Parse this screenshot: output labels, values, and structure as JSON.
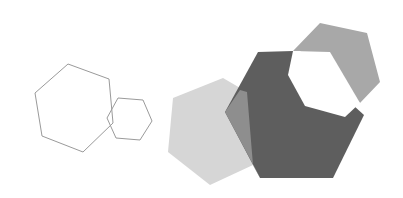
{
  "diagram": {
    "colors": {
      "background": "#ffffff",
      "outline_stroke": "#9a9a9a",
      "light_fill": "#d6d6d6",
      "medium_fill": "#9e9e9e",
      "medium_overlap": "#8a8a8a",
      "dark_fill": "#5e5e5e",
      "top_fill": "#a8a8a8",
      "cutout_fill": "#ffffff"
    },
    "outline_group": {
      "large_hexagon": "68,64 109,79 113,123 83,152 42,136 35,93",
      "small_hexagon": "118,98 143,100 152,121 140,140 116,138 107,118"
    },
    "filled_group": {
      "light_hexagon": "223,78 247,92 253,165 210,185 168,152 173,98",
      "dark_hexagon": "258,52 293,51 364,115 333,178 260,178 225,112",
      "overlap_region": "247,92 253,165 258,170 260,178 225,112 240,90",
      "top_hexagon": "320,23 367,33 380,82 360,103 300,51 293,51",
      "cutout_hexagon": "293,51 330,52 360,103 345,117 305,106 288,75"
    }
  }
}
